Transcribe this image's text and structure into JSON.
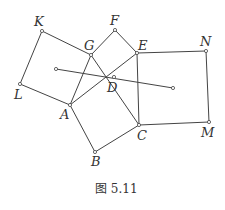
{
  "caption": "图 5.11",
  "labels": {
    "K": "K",
    "F": "F",
    "G": "G",
    "E": "E",
    "N": "N",
    "D": "D",
    "L": "L",
    "A": "A",
    "C": "C",
    "M": "M",
    "B": "B"
  },
  "points": {
    "K": [
      42,
      31
    ],
    "G": [
      91,
      55
    ],
    "F": [
      115,
      30
    ],
    "E": [
      137,
      53
    ],
    "N": [
      206,
      51
    ],
    "D": [
      114,
      77
    ],
    "L": [
      20,
      84
    ],
    "A": [
      70,
      105
    ],
    "C": [
      139,
      125
    ],
    "M": [
      209,
      122
    ],
    "B": [
      95,
      152
    ],
    "P1": [
      56,
      69
    ],
    "P2": [
      173,
      88
    ]
  },
  "line_color": "#444444"
}
